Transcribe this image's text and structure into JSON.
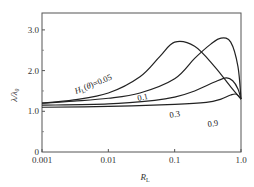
{
  "chart_data": {
    "type": "line",
    "title": "",
    "xlabel": "R_L",
    "ylabel": "λ/λ0",
    "xscale": "log",
    "xlim": [
      0.001,
      1.0
    ],
    "ylim": [
      0,
      3.4
    ],
    "x_ticks": [
      "0.001",
      "0.01",
      "0.1",
      "1.0"
    ],
    "y_ticks": [
      "0",
      "1.0",
      "2.0",
      "3.0"
    ],
    "grid": false,
    "legend": "inline curve labels",
    "series": [
      {
        "name": "H_L(θ)=0.05",
        "label": "H_L(θ)=0.05",
        "x": [
          0.001,
          0.003,
          0.01,
          0.03,
          0.06,
          0.1,
          0.2,
          0.4,
          0.7,
          1.0
        ],
        "y": [
          1.2,
          1.28,
          1.45,
          1.85,
          2.35,
          2.7,
          2.6,
          2.1,
          1.6,
          1.3
        ]
      },
      {
        "name": "0.1",
        "label": "0.1",
        "x": [
          0.001,
          0.003,
          0.01,
          0.03,
          0.1,
          0.2,
          0.35,
          0.5,
          0.7,
          0.9,
          1.0
        ],
        "y": [
          1.2,
          1.25,
          1.32,
          1.45,
          1.8,
          2.3,
          2.65,
          2.8,
          2.7,
          2.1,
          1.3
        ]
      },
      {
        "name": "0.3",
        "label": "0.3",
        "x": [
          0.001,
          0.01,
          0.05,
          0.1,
          0.2,
          0.4,
          0.6,
          0.75,
          0.9,
          1.0
        ],
        "y": [
          1.15,
          1.18,
          1.27,
          1.35,
          1.5,
          1.72,
          1.82,
          1.75,
          1.55,
          1.3
        ]
      },
      {
        "name": "0.9",
        "label": "0.9",
        "x": [
          0.001,
          0.01,
          0.1,
          0.3,
          0.5,
          0.7,
          0.85,
          1.0
        ],
        "y": [
          1.1,
          1.12,
          1.17,
          1.22,
          1.3,
          1.4,
          1.42,
          1.3
        ]
      }
    ]
  },
  "labels": {
    "ylabel": "λ/λ₀",
    "xlabel": "R_L",
    "y_ticks": [
      "0",
      "1.0",
      "2.0",
      "3.0"
    ],
    "x_ticks": [
      "0.001",
      "0.01",
      "0.1",
      "1.0"
    ],
    "curve_labels": [
      "H_L(θ)=0.05",
      "0.1",
      "0.3",
      "0.9"
    ]
  }
}
